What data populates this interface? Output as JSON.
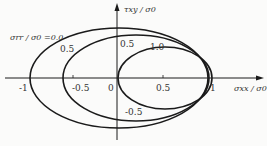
{
  "figure": {
    "type": "diagram"
  },
  "axes": {
    "x_label": "σxx / σ0",
    "y_label": "τxy / σ0",
    "x_ticks": [
      "-1",
      "-0.5",
      "0",
      "0.5",
      "1"
    ],
    "y_tick_labels": {
      "top": "0.5",
      "bottom": "-0.5"
    }
  },
  "curves": [
    {
      "label": "σrr / σ0 =0.0",
      "param": 0.0,
      "x_min": -1.0,
      "x_max": 1.0,
      "y_max": 0.55
    },
    {
      "label": "0.5",
      "param": 0.5,
      "x_min": -0.6,
      "x_max": 1.0,
      "y_max": 0.47
    },
    {
      "label": "1.0",
      "param": 1.0,
      "x_min": 0.0,
      "x_max": 1.05,
      "y_max": 0.34
    }
  ],
  "colors": {
    "line": "#1a1a1a",
    "text": "#333333",
    "background": "#fbfbfa"
  }
}
